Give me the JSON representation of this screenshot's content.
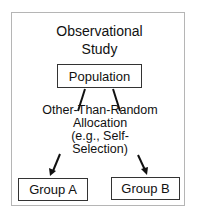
{
  "diagram": {
    "title_line1": "Observational",
    "title_line2": "Study",
    "population": "Population",
    "allocation_line1": "Other-Than-Random",
    "allocation_line2": "Allocation",
    "allocation_line3": "(e.g., Self-",
    "allocation_line4": "Selection)",
    "group_a": "Group A",
    "group_b": "Group B"
  }
}
